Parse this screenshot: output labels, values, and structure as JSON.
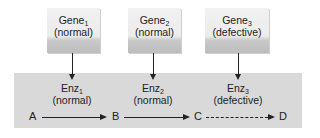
{
  "diagram": {
    "genes": [
      {
        "name": "Gene",
        "sub": "1",
        "status": "(normal)"
      },
      {
        "name": "Gene",
        "sub": "2",
        "status": "(normal)"
      },
      {
        "name": "Gene",
        "sub": "3",
        "status": "(defective)"
      }
    ],
    "enzymes": [
      {
        "name": "Enz",
        "sub": "1",
        "status": "(normal)"
      },
      {
        "name": "Enz",
        "sub": "2",
        "status": "(normal)"
      },
      {
        "name": "Enz",
        "sub": "3",
        "status": "(defective)"
      }
    ],
    "metabolites": [
      "A",
      "B",
      "C",
      "D"
    ],
    "edges": [
      {
        "from": "A",
        "to": "B",
        "style": "solid"
      },
      {
        "from": "B",
        "to": "C",
        "style": "solid"
      },
      {
        "from": "C",
        "to": "D",
        "style": "dashed"
      }
    ],
    "colors": {
      "panel": "#d9d9d9",
      "line": "#222222",
      "box": "#ececec"
    }
  }
}
